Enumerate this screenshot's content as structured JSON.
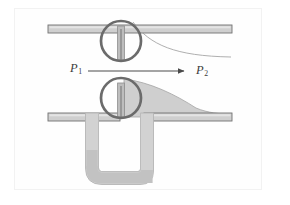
{
  "figure": {
    "background_color": "#ffffff",
    "frame_color": "#f2f2f2",
    "labels": {
      "p1": {
        "symbol": "P",
        "subscript": "1",
        "x": 70,
        "y": 62
      },
      "p2": {
        "symbol": "P",
        "subscript": "2",
        "x": 196,
        "y": 64
      }
    },
    "flow_arrow": {
      "name": "flow-direction-arrow",
      "direction": "right",
      "x1": 88,
      "x2": 188,
      "y": 71,
      "color": "#4a4a4a"
    },
    "colors": {
      "pipe_fill": "#cfcfcf",
      "pipe_stroke": "#6e6e6e",
      "valve_ring": "#6b6b6b",
      "valve_plug": "#b8b8b8",
      "jet_fill": "#cccccc",
      "jet_stroke": "#9a9a9a",
      "profile_curve": "#8a8a8a",
      "manometer_wall": "#cdcdcd",
      "manometer_wall_stroke": "#b0b0b0",
      "manometer_fluid": "#c0c0c0"
    },
    "upper_pipe": {
      "name": "upper-pipe-wall",
      "x": 48,
      "y": 25,
      "width": 184,
      "height": 8
    },
    "lower_pipe_left": {
      "name": "lower-pipe-wall-left",
      "x": 48,
      "y": 113,
      "width": 72,
      "height": 8
    },
    "lower_pipe_right": {
      "name": "lower-pipe-wall-right",
      "x": 144,
      "y": 113,
      "width": 88,
      "height": 8
    },
    "upper_valve": {
      "name": "upper-orifice-valve",
      "cx": 121,
      "cy": 41,
      "r": 20,
      "ring_width": 2.6
    },
    "lower_valve": {
      "name": "lower-orifice-valve",
      "cx": 121,
      "cy": 98,
      "r": 20,
      "ring_width": 2.6
    },
    "velocity_profile_curve": {
      "name": "velocity-profile-curve",
      "description": "thin curve flaring from orifice to pipe wall"
    },
    "jet_region": {
      "name": "jet-wake-region",
      "description": "filled gray expanding jet downstream of orifice"
    },
    "manometer": {
      "name": "u-tube-manometer",
      "left_leg_x": 92,
      "right_leg_x": 140,
      "top_y": 113,
      "bottom_y": 178,
      "tube_width": 13,
      "fluid_left_level_y": 150,
      "fluid_right_level_y": 170
    }
  }
}
